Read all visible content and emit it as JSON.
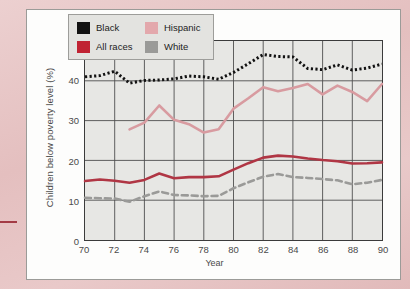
{
  "chart_data": {
    "type": "line",
    "title": "",
    "xlabel": "Year",
    "ylabel": "Children below poverty level (%)",
    "xlim": [
      70,
      90
    ],
    "ylim": [
      0,
      50
    ],
    "xticks": [
      "70",
      "72",
      "74",
      "76",
      "78",
      "80",
      "82",
      "84",
      "86",
      "88",
      "90"
    ],
    "yticks": [
      "0",
      "10",
      "20",
      "30",
      "40",
      "50"
    ],
    "grid": "both",
    "legend_position": "top-left",
    "x": [
      70,
      71,
      72,
      73,
      74,
      75,
      76,
      77,
      78,
      79,
      80,
      81,
      82,
      83,
      84,
      85,
      86,
      87,
      88,
      89,
      90
    ],
    "series": [
      {
        "name": "Black",
        "color": "#121212",
        "style": "dotted",
        "values": [
          41.0,
          41.3,
          42.4,
          39.4,
          40.1,
          40.2,
          40.5,
          41.2,
          41.0,
          40.4,
          42.1,
          44.3,
          46.6,
          46.1,
          46.0,
          43.1,
          42.8,
          44.0,
          42.7,
          43.2,
          44.2
        ]
      },
      {
        "name": "Hispanic",
        "color": "#d89ba0",
        "style": "solid",
        "values": [
          null,
          null,
          null,
          27.8,
          29.5,
          33.8,
          30.2,
          29.1,
          27.0,
          27.8,
          33.0,
          35.6,
          38.4,
          37.4,
          38.2,
          39.2,
          36.6,
          38.8,
          37.2,
          34.9,
          39.2
        ]
      },
      {
        "name": "All races",
        "color": "#b03644",
        "style": "solid",
        "values": [
          14.8,
          15.2,
          14.9,
          14.4,
          15.1,
          16.7,
          15.5,
          15.8,
          15.8,
          16.0,
          17.7,
          19.3,
          20.7,
          21.2,
          21.0,
          20.5,
          20.1,
          19.8,
          19.2,
          19.3,
          19.5
        ]
      },
      {
        "name": "White",
        "color": "#9a9a98",
        "style": "dashed",
        "values": [
          10.6,
          10.5,
          10.4,
          9.6,
          11.0,
          12.2,
          11.3,
          11.2,
          11.0,
          11.1,
          13.0,
          14.5,
          15.9,
          16.6,
          15.8,
          15.6,
          15.3,
          15.0,
          14.0,
          14.4,
          15.1
        ]
      }
    ]
  },
  "legend": {
    "entries": [
      {
        "label": "Black",
        "swatch_color": "#121212"
      },
      {
        "label": "Hispanic",
        "swatch_color": "#e3a8ac"
      },
      {
        "label": "All races",
        "swatch_color": "#c02333"
      },
      {
        "label": "White",
        "swatch_color": "#9a9a98"
      }
    ]
  },
  "axes": {
    "ylabel": "Children below poverty level (%)",
    "xlabel": "Year"
  }
}
